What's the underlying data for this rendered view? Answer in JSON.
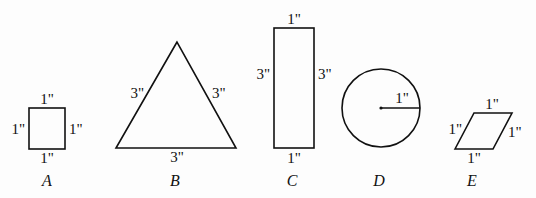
{
  "figures": [
    {
      "id": "A",
      "type": "square",
      "name": "A",
      "labels": {
        "top": "1\"",
        "left": "1\"",
        "right": "1\"",
        "bottom": "1\""
      }
    },
    {
      "id": "B",
      "type": "equilateral-triangle",
      "name": "B",
      "labels": {
        "left": "3\"",
        "right": "3\"",
        "bottom": "3\""
      }
    },
    {
      "id": "C",
      "type": "rectangle",
      "name": "C",
      "labels": {
        "top": "1\"",
        "left": "3\"",
        "right": "3\"",
        "bottom": "1\""
      }
    },
    {
      "id": "D",
      "type": "circle",
      "name": "D",
      "labels": {
        "radius": "1\""
      }
    },
    {
      "id": "E",
      "type": "rhombus",
      "name": "E",
      "labels": {
        "top": "1\"",
        "left": "1\"",
        "right": "1\"",
        "bottom": "1\""
      }
    }
  ]
}
